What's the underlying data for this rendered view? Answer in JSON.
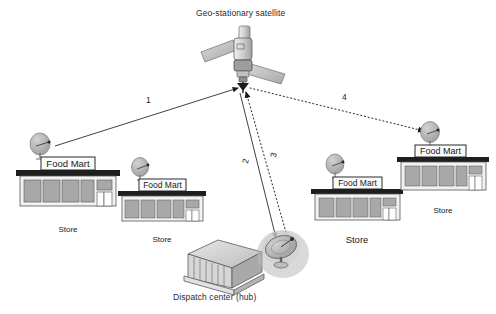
{
  "diagram": {
    "title_satellite": "Geo-stationary satellite",
    "title_hub": "Dispatch center (hub)",
    "store_sign_text": "Food Mart",
    "store_caption": "Store",
    "background_color": "#ffffff",
    "line_color": "#2b2b2b",
    "roof_color": "#1e1e1e",
    "window_color": "#a8a8a8",
    "dish_color": "#b5b5b5"
  },
  "nodes": {
    "satellite": {
      "name": "Geo-stationary satellite",
      "x": 243,
      "y": 85
    },
    "hub": {
      "name": "Dispatch center (hub)",
      "x": 283,
      "y": 247
    },
    "stores": [
      {
        "id": "store-1",
        "sign": "Food Mart",
        "caption": "Store",
        "x": 15,
        "y": 168,
        "scale": 1.0,
        "caption_size": "small",
        "dish_x": 38,
        "dish_y": 138
      },
      {
        "id": "store-2",
        "sign": "Food Mart",
        "caption": "Store",
        "x": 120,
        "y": 182,
        "scale": 0.82,
        "caption_size": "small",
        "dish_x": 136,
        "dish_y": 163
      },
      {
        "id": "store-3",
        "sign": "Food Mart",
        "caption": "Store",
        "x": 310,
        "y": 182,
        "scale": 0.85,
        "caption_size": "big",
        "dish_x": 330,
        "dish_y": 159
      },
      {
        "id": "store-4",
        "sign": "Food Mart",
        "caption": "Store",
        "x": 398,
        "y": 148,
        "scale": 0.95,
        "caption_size": "small",
        "dish_x": 428,
        "dish_y": 124
      }
    ]
  },
  "links": [
    {
      "id": "link-1",
      "label": "1",
      "style": "solid",
      "from": "store-1",
      "to": "satellite",
      "label_x": 146,
      "label_y": 101
    },
    {
      "id": "link-2",
      "label": "2",
      "style": "solid",
      "from": "satellite",
      "to": "hub",
      "label_x": 245,
      "label_y": 163
    },
    {
      "id": "link-3",
      "label": "3",
      "style": "dotted",
      "from": "hub",
      "to": "satellite",
      "label_x": 273,
      "label_y": 157
    },
    {
      "id": "link-4",
      "label": "4",
      "style": "dotted",
      "from": "satellite",
      "to": "store-4",
      "label_x": 343,
      "label_y": 98
    }
  ]
}
